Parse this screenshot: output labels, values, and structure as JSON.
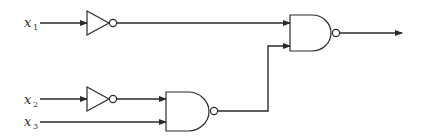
{
  "diagram": {
    "type": "logic-circuit",
    "inputs": [
      {
        "name": "x",
        "subscript": "1"
      },
      {
        "name": "x",
        "subscript": "2"
      },
      {
        "name": "x",
        "subscript": "3"
      }
    ],
    "gates": [
      {
        "id": "inv1",
        "type": "NOT",
        "input": "x1"
      },
      {
        "id": "inv2",
        "type": "NOT",
        "input": "x2"
      },
      {
        "id": "nand_bottom",
        "type": "NAND",
        "inputs": [
          "inv2",
          "x3"
        ]
      },
      {
        "id": "nand_top",
        "type": "NAND",
        "inputs": [
          "inv1",
          "nand_bottom"
        ]
      }
    ],
    "output": "nand_top",
    "colors": {
      "line": "#2a2a2a",
      "background": "#ffffff"
    }
  }
}
